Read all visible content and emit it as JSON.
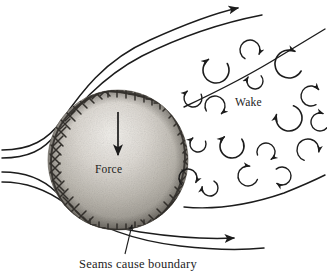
{
  "figure": {
    "title_caption": "Seams cause boundary",
    "labels": {
      "force": "Force",
      "wake": "Wake"
    },
    "colors": {
      "ink": "#1c1c1c",
      "background": "#ffffff",
      "ball_light": "#e8e6e2",
      "ball_mid": "#b8b5ae",
      "ball_shadow": "#8d8a84",
      "seam": "#3a3733"
    },
    "ball": {
      "center_x": 118,
      "center_y": 160,
      "radius": 70
    },
    "force_arrow": {
      "x": 118,
      "y_start": 112,
      "y_end": 158,
      "direction": "down"
    },
    "streamlines": [
      {
        "name": "upper-outer-streamline",
        "path": "M 2 150 C 30 150 48 140 62 120 C 80 94 104 60 150 40 C 190 22 220 12 238 8",
        "arrowhead": {
          "x": 240,
          "y": 7,
          "angle": -18
        }
      },
      {
        "name": "upper-inner-streamline",
        "path": "M 2 158 C 28 158 44 150 56 134 C 74 110 100 78 142 56 C 182 36 226 22 258 16",
        "arrowhead": null
      },
      {
        "name": "lower-inner-streamline",
        "path": "M 2 172 C 28 172 44 180 56 192 C 74 210 100 226 140 232 C 180 238 214 239 236 238",
        "arrowhead": {
          "x": 238,
          "y": 238,
          "angle": 2
        }
      },
      {
        "name": "lower-outer-streamline",
        "path": "M 2 182 C 30 182 50 192 66 204 C 92 224 130 240 180 246 C 215 250 244 250 262 248",
        "arrowhead": null
      },
      {
        "name": "wake-upper-boundary",
        "path": "M 186 106 C 216 92 252 74 284 54 C 302 43 316 34 325 28",
        "arrowhead": null
      },
      {
        "name": "wake-lower-boundary",
        "path": "M 186 208 C 218 210 254 204 286 192 C 306 184 318 178 325 174",
        "arrowhead": null
      }
    ],
    "leader_line": {
      "name": "seam-leader-line",
      "path": "M 125 253 L 132 224",
      "arrowhead": {
        "x": 132,
        "y": 222,
        "angle": -76
      }
    },
    "vortices": [
      {
        "cx": 216,
        "cy": 70,
        "r": 13,
        "rot": -30,
        "sweep": 265,
        "arrow": true
      },
      {
        "cx": 250,
        "cy": 50,
        "r": 10,
        "rot": 120,
        "sweep": 265,
        "arrow": true
      },
      {
        "cx": 255,
        "cy": 81,
        "r": 8,
        "rot": -40,
        "sweep": 250,
        "arrow": true
      },
      {
        "cx": 289,
        "cy": 64,
        "r": 14,
        "rot": 30,
        "sweep": 265,
        "arrow": true
      },
      {
        "cx": 193,
        "cy": 98,
        "r": 9,
        "rot": -25,
        "sweep": 255,
        "arrow": true
      },
      {
        "cx": 215,
        "cy": 106,
        "r": 10,
        "rot": 150,
        "sweep": 260,
        "arrow": true
      },
      {
        "cx": 311,
        "cy": 96,
        "r": 10,
        "rot": 60,
        "sweep": 260,
        "arrow": true
      },
      {
        "cx": 289,
        "cy": 118,
        "r": 13,
        "rot": -70,
        "sweep": 265,
        "arrow": true
      },
      {
        "cx": 198,
        "cy": 144,
        "r": 8,
        "rot": -20,
        "sweep": 250,
        "arrow": true
      },
      {
        "cx": 232,
        "cy": 146,
        "r": 12,
        "rot": -35,
        "sweep": 265,
        "arrow": true
      },
      {
        "cx": 266,
        "cy": 152,
        "r": 9,
        "rot": 160,
        "sweep": 255,
        "arrow": true
      },
      {
        "cx": 308,
        "cy": 150,
        "r": 11,
        "rot": 110,
        "sweep": 260,
        "arrow": true
      },
      {
        "cx": 188,
        "cy": 178,
        "r": 9,
        "rot": 135,
        "sweep": 255,
        "arrow": true
      },
      {
        "cx": 210,
        "cy": 188,
        "r": 8,
        "rot": -60,
        "sweep": 250,
        "arrow": true
      },
      {
        "cx": 248,
        "cy": 176,
        "r": 10,
        "rot": 20,
        "sweep": 260,
        "arrow": true
      },
      {
        "cx": 282,
        "cy": 176,
        "r": 9,
        "rot": -130,
        "sweep": 255,
        "arrow": true
      },
      {
        "cx": 320,
        "cy": 122,
        "r": 9,
        "rot": 40,
        "sweep": 250,
        "arrow": true
      }
    ],
    "seams": [
      {
        "name": "left-seam-arc",
        "path": "M 104 92 C 72 102 52 128 52 160 C 52 188 66 210 88 222"
      },
      {
        "name": "right-seam-arc",
        "path": "M 160 100 C 180 118 188 142 184 168 C 180 194 166 214 146 226"
      }
    ]
  }
}
